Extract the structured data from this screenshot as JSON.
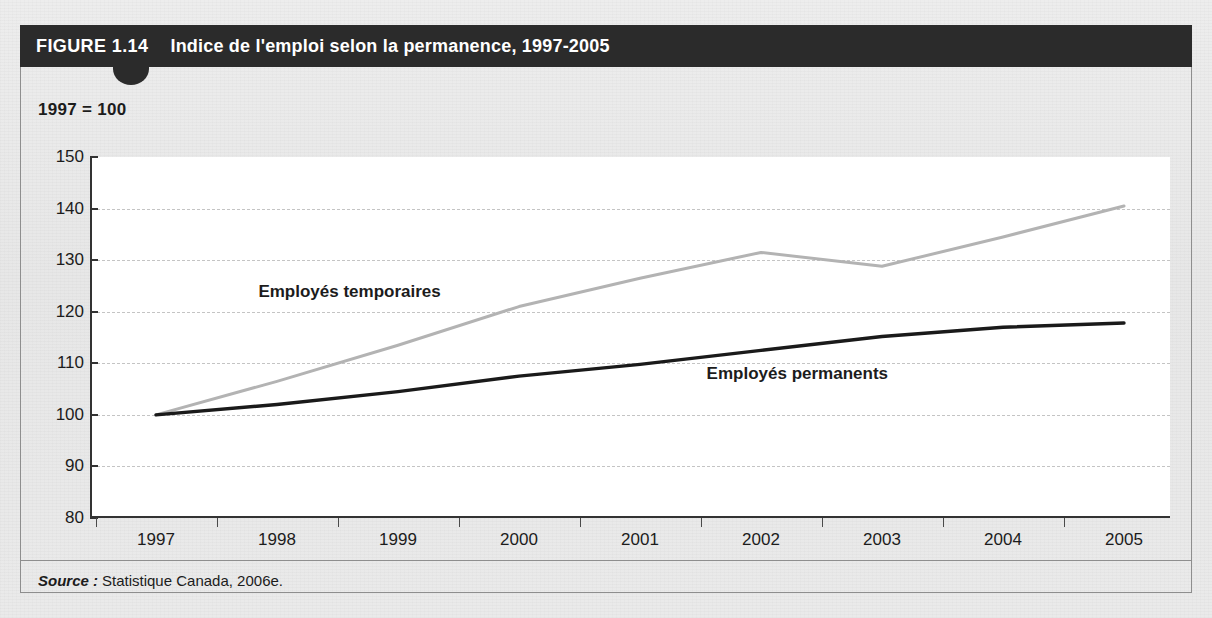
{
  "figure": {
    "number_label": "FIGURE 1.14",
    "title": "Indice de l'emploi selon la permanence, 1997-2005",
    "unit_label": "1997 = 100",
    "source_label": "Source :",
    "source_text": "Statistique Canada, 2006e."
  },
  "colors": {
    "banner_background": "#2b2b2b",
    "banner_text": "#ffffff",
    "page_background": "#e9e9e9",
    "plot_background": "#ffffff",
    "gridline": "#c4c4c4",
    "axis": "#333333",
    "series_temporaires": "#b3b3b3",
    "series_permanents": "#1a1a1a"
  },
  "chart_data": {
    "type": "line",
    "title": "Indice de l'emploi selon la permanence, 1997-2005",
    "xlabel": "",
    "ylabel": "1997 = 100",
    "ylim": [
      80,
      150
    ],
    "yticks": [
      80,
      90,
      100,
      110,
      120,
      130,
      140,
      150
    ],
    "ytick_labels": [
      "80",
      "90",
      "100",
      "110",
      "120",
      "130",
      "140",
      "150"
    ],
    "grid": "horizontal-dashed",
    "gridline_values": [
      90,
      100,
      110,
      120,
      130,
      140
    ],
    "legend": "inline-annotations",
    "categories": [
      "1997",
      "1998",
      "1999",
      "2000",
      "2001",
      "2002",
      "2003",
      "2004",
      "2005"
    ],
    "x": [
      1997,
      1998,
      1999,
      2000,
      2001,
      2002,
      2003,
      2004,
      2005
    ],
    "series": [
      {
        "name": "Employés temporaires",
        "color": "#b3b3b3",
        "values": [
          100.0,
          106.5,
          113.5,
          121.0,
          126.5,
          131.5,
          128.8,
          134.5,
          140.5
        ],
        "annotation": {
          "text": "Employés temporaires",
          "x": 1998.6,
          "y": 123.5
        }
      },
      {
        "name": "Employés permanents",
        "color": "#1a1a1a",
        "values": [
          100.0,
          102.0,
          104.5,
          107.5,
          109.8,
          112.5,
          115.2,
          117.0,
          117.8
        ],
        "annotation": {
          "text": "Employés permanents",
          "x": 2002.3,
          "y": 107.5
        }
      }
    ]
  }
}
